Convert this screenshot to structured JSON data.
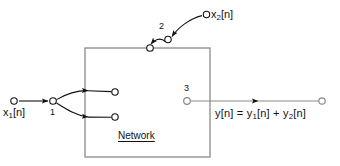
{
  "figure": {
    "type": "block-diagram",
    "width": 340,
    "height": 166,
    "background_color": "#ffffff",
    "line_color": "#8a8a8a",
    "wire_color": "#111111",
    "text_color": "#111111"
  },
  "block": {
    "label": "Network",
    "x": 85,
    "y": 48,
    "width": 125,
    "height": 109
  },
  "terminals": [
    {
      "id": "1",
      "label": "1",
      "x": 53,
      "y": 101,
      "description": "input terminal one on network boundary"
    },
    {
      "id": "2",
      "label": "2",
      "x": 168,
      "y": 40,
      "description": "switch pivot terminal two above network"
    },
    {
      "id": "3",
      "label": "3",
      "x": 187,
      "y": 101,
      "description": "output terminal three inside network"
    }
  ],
  "signals": {
    "input_1": "x₁[n]",
    "input_1_base": "x",
    "input_1_sub": "1",
    "input_1_tail": "[n]",
    "input_2_base": "x",
    "input_2_sub": "2",
    "input_2_tail": "[n]",
    "output_expression": "y[n] = y₁[n] + y₂[n]",
    "output_parts": {
      "lhs": "y[n] = y",
      "sub1": "1",
      "mid": "[n] + y",
      "sub2": "2",
      "tail": "[n]"
    }
  },
  "nodes": [
    {
      "name": "x1-source-node",
      "x": 14,
      "y": 101
    },
    {
      "name": "terminal-1-node",
      "x": 53,
      "y": 101
    },
    {
      "name": "branch-upper-node",
      "x": 115,
      "y": 92
    },
    {
      "name": "branch-lower-node",
      "x": 115,
      "y": 117
    },
    {
      "name": "switch-contact-node",
      "x": 150,
      "y": 48
    },
    {
      "name": "terminal-2-node",
      "x": 168,
      "y": 48
    },
    {
      "name": "x2-source-node",
      "x": 207,
      "y": 14
    },
    {
      "name": "terminal-3-node",
      "x": 187,
      "y": 101
    },
    {
      "name": "output-sink-node",
      "x": 322,
      "y": 101
    }
  ]
}
